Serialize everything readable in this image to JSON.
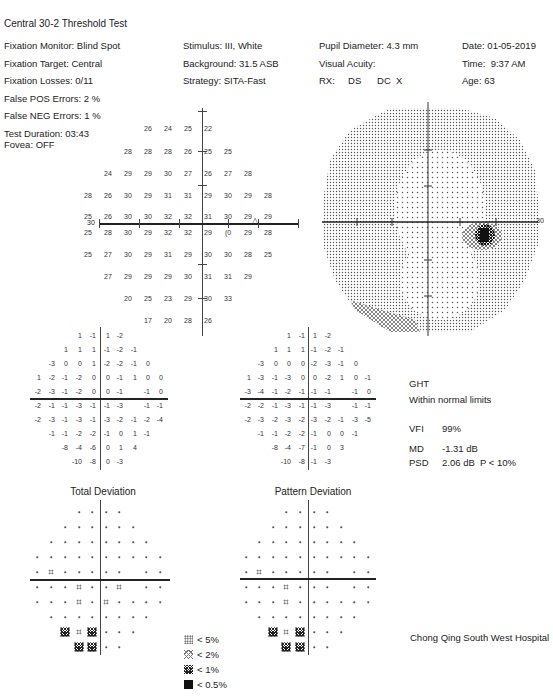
{
  "header": {
    "test_name": "Central 30-2 Threshold Test"
  },
  "patient_info": {
    "left_column": [
      "Fixation Monitor: Blind Spot",
      "Fixation Target: Central",
      "Fixation Losses: 0/11",
      "False POS Errors:   2 %",
      "False NEG Errors:   1 %",
      "Test Duration: 03:43"
    ],
    "fovea": "Fovea: OFF",
    "middle_column": [
      "Stimulus: III, White",
      "Background: 31.5 ASB",
      "Strategy: SITA-Fast"
    ],
    "right_column": [
      "Pupil Diameter: 4.3 mm",
      "Visual Acuity:",
      "RX:     DS      DC  X"
    ],
    "far_right_column": [
      "Date: 01-05-2019",
      "Time:  9:37 AM",
      "Age: 63"
    ]
  },
  "threshold_plot": {
    "axis_label_left": "30",
    "axis_label_right": "30",
    "blind_spot_marker": "△",
    "rows": [
      {
        "y": 128,
        "cells": [
          {
            "x": 148,
            "v": "26"
          },
          {
            "x": 168,
            "v": "24"
          },
          {
            "x": 188,
            "v": "25"
          },
          {
            "x": 208,
            "v": "22"
          }
        ]
      },
      {
        "y": 151,
        "cells": [
          {
            "x": 128,
            "v": "28"
          },
          {
            "x": 148,
            "v": "28"
          },
          {
            "x": 168,
            "v": "28"
          },
          {
            "x": 188,
            "v": "26"
          },
          {
            "x": 208,
            "v": "25"
          },
          {
            "x": 228,
            "v": "25"
          }
        ]
      },
      {
        "y": 173,
        "cells": [
          {
            "x": 108,
            "v": "24"
          },
          {
            "x": 128,
            "v": "29"
          },
          {
            "x": 148,
            "v": "29"
          },
          {
            "x": 168,
            "v": "30"
          },
          {
            "x": 188,
            "v": "27"
          },
          {
            "x": 208,
            "v": "26"
          },
          {
            "x": 228,
            "v": "27"
          },
          {
            "x": 248,
            "v": "28"
          }
        ]
      },
      {
        "y": 195,
        "cells": [
          {
            "x": 88,
            "v": "28"
          },
          {
            "x": 108,
            "v": "26"
          },
          {
            "x": 128,
            "v": "30"
          },
          {
            "x": 148,
            "v": "29"
          },
          {
            "x": 168,
            "v": "31"
          },
          {
            "x": 188,
            "v": "31"
          },
          {
            "x": 208,
            "v": "29"
          },
          {
            "x": 228,
            "v": "30"
          },
          {
            "x": 248,
            "v": "29"
          },
          {
            "x": 268,
            "v": "28"
          }
        ]
      },
      {
        "y": 216,
        "cells": [
          {
            "x": 88,
            "v": "25"
          },
          {
            "x": 108,
            "v": "26"
          },
          {
            "x": 128,
            "v": "30"
          },
          {
            "x": 148,
            "v": "30"
          },
          {
            "x": 168,
            "v": "32"
          },
          {
            "x": 188,
            "v": "32"
          },
          {
            "x": 208,
            "v": "31"
          },
          {
            "x": 228,
            "v": "30"
          },
          {
            "x": 248,
            "v": "29"
          },
          {
            "x": 268,
            "v": "29"
          }
        ]
      },
      {
        "y": 232,
        "cells": [
          {
            "x": 88,
            "v": "25"
          },
          {
            "x": 108,
            "v": "28"
          },
          {
            "x": 128,
            "v": "30"
          },
          {
            "x": 148,
            "v": "29"
          },
          {
            "x": 168,
            "v": "32"
          },
          {
            "x": 188,
            "v": "32"
          },
          {
            "x": 208,
            "v": "29"
          },
          {
            "x": 228,
            "v": "(0"
          },
          {
            "x": 248,
            "v": "29"
          },
          {
            "x": 268,
            "v": "28"
          }
        ]
      },
      {
        "y": 254,
        "cells": [
          {
            "x": 88,
            "v": "25"
          },
          {
            "x": 108,
            "v": "27"
          },
          {
            "x": 128,
            "v": "30"
          },
          {
            "x": 148,
            "v": "29"
          },
          {
            "x": 168,
            "v": "31"
          },
          {
            "x": 188,
            "v": "29"
          },
          {
            "x": 208,
            "v": "30"
          },
          {
            "x": 228,
            "v": "30"
          },
          {
            "x": 248,
            "v": "28"
          },
          {
            "x": 268,
            "v": "25"
          }
        ]
      },
      {
        "y": 276,
        "cells": [
          {
            "x": 108,
            "v": "27"
          },
          {
            "x": 128,
            "v": "29"
          },
          {
            "x": 148,
            "v": "29"
          },
          {
            "x": 168,
            "v": "29"
          },
          {
            "x": 188,
            "v": "30"
          },
          {
            "x": 208,
            "v": "31"
          },
          {
            "x": 228,
            "v": "31"
          },
          {
            "x": 248,
            "v": "29"
          }
        ]
      },
      {
        "y": 298,
        "cells": [
          {
            "x": 128,
            "v": "20"
          },
          {
            "x": 148,
            "v": "25"
          },
          {
            "x": 168,
            "v": "23"
          },
          {
            "x": 188,
            "v": "29"
          },
          {
            "x": 208,
            "v": "30"
          },
          {
            "x": 228,
            "v": "33"
          }
        ]
      },
      {
        "y": 320,
        "cells": [
          {
            "x": 148,
            "v": "17"
          },
          {
            "x": 168,
            "v": "20"
          },
          {
            "x": 188,
            "v": "28"
          },
          {
            "x": 208,
            "v": "26"
          }
        ]
      }
    ]
  },
  "grayscale_plot": {
    "axis_label_right": "30"
  },
  "total_deviation": {
    "title": "Total Deviation",
    "rows": [
      [
        "",
        "",
        "",
        "1",
        "-1",
        "1",
        "-2",
        "",
        "",
        ""
      ],
      [
        "",
        "",
        "1",
        "1",
        "1",
        "-1",
        "-2",
        "-1",
        "",
        ""
      ],
      [
        "",
        "-3",
        "0",
        "0",
        "1",
        "-2",
        "-2",
        "-1",
        "0",
        ""
      ],
      [
        "1",
        "-2",
        "-1",
        "-2",
        "0",
        "0",
        "-1",
        "1",
        "0",
        "0"
      ],
      [
        "-2",
        "-3",
        "-1",
        "-2",
        "0",
        "0",
        "-1",
        "",
        "-1",
        "0"
      ],
      [
        "-2",
        "-1",
        "-1",
        "-3",
        "-1",
        "-1",
        "-3",
        "",
        "-1",
        "-1"
      ],
      [
        "-2",
        "-3",
        "-1",
        "-3",
        "-1",
        "-3",
        "-2",
        "-1",
        "-2",
        "-4"
      ],
      [
        "",
        "-1",
        "-1",
        "-2",
        "-2",
        "-1",
        "0",
        "1",
        "-1",
        ""
      ],
      [
        "",
        "",
        "-8",
        "-4",
        "-6",
        "0",
        "1",
        "4",
        "",
        ""
      ],
      [
        "",
        "",
        "",
        "-10",
        "-8",
        "0",
        "-3",
        "",
        "",
        ""
      ]
    ],
    "prob_rows": [
      [
        "",
        "",
        "",
        "dot",
        "dot",
        "dot",
        "dot",
        "",
        "",
        ""
      ],
      [
        "",
        "",
        "dot",
        "dot",
        "dot",
        "dot",
        "dot",
        "dot",
        "",
        ""
      ],
      [
        "",
        "dot",
        "dot",
        "dot",
        "dot",
        "dot",
        "dot",
        "dot",
        "dot",
        ""
      ],
      [
        "dot",
        "dot",
        "dot",
        "dot",
        "dot",
        "dot",
        "dot",
        "dot",
        "dot",
        "dot"
      ],
      [
        "dot",
        "p5",
        "dot",
        "dot",
        "dot",
        "dot",
        "dot",
        "",
        "dot",
        "dot"
      ],
      [
        "dot",
        "dot",
        "dot",
        "p5",
        "dot",
        "dot",
        "p5",
        "",
        "dot",
        "dot"
      ],
      [
        "dot",
        "dot",
        "dot",
        "p5",
        "dot",
        "p5",
        "dot",
        "dot",
        "dot",
        "dot"
      ],
      [
        "",
        "dot",
        "dot",
        "dot",
        "dot",
        "dot",
        "dot",
        "dot",
        "dot",
        ""
      ],
      [
        "",
        "",
        "p1",
        "p5",
        "p1",
        "dot",
        "dot",
        "dot",
        "",
        ""
      ],
      [
        "",
        "",
        "",
        "p1",
        "p1",
        "dot",
        "dot",
        "",
        "",
        ""
      ]
    ]
  },
  "pattern_deviation": {
    "title": "Pattern Deviation",
    "rows": [
      [
        "",
        "",
        "",
        "1",
        "-1",
        "1",
        "-2",
        "",
        "",
        ""
      ],
      [
        "",
        "",
        "1",
        "1",
        "1",
        "-1",
        "-2",
        "-1",
        "",
        ""
      ],
      [
        "",
        "-3",
        "0",
        "0",
        "0",
        "-2",
        "-3",
        "-1",
        "0",
        ""
      ],
      [
        "1",
        "-3",
        "-1",
        "-3",
        "0",
        "0",
        "-2",
        "1",
        "0",
        "-1"
      ],
      [
        "-3",
        "-4",
        "-1",
        "-2",
        "-1",
        "-1",
        "-1",
        "",
        "-1",
        "0"
      ],
      [
        "-2",
        "-2",
        "-1",
        "-3",
        "-1",
        "-1",
        "-3",
        "",
        "-1",
        "-1"
      ],
      [
        "-2",
        "-3",
        "-2",
        "-3",
        "-2",
        "-3",
        "-2",
        "-1",
        "-3",
        "-5"
      ],
      [
        "",
        "-1",
        "-1",
        "-2",
        "-2",
        "-1",
        "0",
        "0",
        "-1",
        ""
      ],
      [
        "",
        "",
        "-8",
        "-4",
        "-7",
        "-1",
        "0",
        "3",
        "",
        ""
      ],
      [
        "",
        "",
        "",
        "-10",
        "-8",
        "-1",
        "-3",
        "",
        "",
        ""
      ]
    ],
    "prob_rows": [
      [
        "",
        "",
        "",
        "dot",
        "dot",
        "dot",
        "dot",
        "",
        "",
        ""
      ],
      [
        "",
        "",
        "dot",
        "dot",
        "dot",
        "dot",
        "dot",
        "dot",
        "",
        ""
      ],
      [
        "",
        "dot",
        "dot",
        "dot",
        "dot",
        "dot",
        "dot",
        "dot",
        "dot",
        ""
      ],
      [
        "dot",
        "dot",
        "dot",
        "dot",
        "dot",
        "dot",
        "dot",
        "dot",
        "dot",
        "dot"
      ],
      [
        "dot",
        "p5",
        "dot",
        "dot",
        "dot",
        "dot",
        "dot",
        "",
        "dot",
        "dot"
      ],
      [
        "dot",
        "dot",
        "dot",
        "p5",
        "dot",
        "dot",
        "dot",
        "",
        "dot",
        "dot"
      ],
      [
        "dot",
        "dot",
        "dot",
        "p5",
        "dot",
        "dot",
        "dot",
        "dot",
        "dot",
        "dot"
      ],
      [
        "",
        "dot",
        "dot",
        "dot",
        "dot",
        "dot",
        "dot",
        "dot",
        "dot",
        ""
      ],
      [
        "",
        "",
        "p1",
        "p5",
        "p1",
        "dot",
        "dot",
        "dot",
        "",
        ""
      ],
      [
        "",
        "",
        "",
        "p1",
        "p1",
        "dot",
        "dot",
        "",
        "",
        ""
      ]
    ]
  },
  "indices": {
    "ght_label": "GHT",
    "ght_value": "Within normal limits",
    "vfi_label": "VFI",
    "vfi_value": "99%",
    "md_label": "MD",
    "md_value": "-1.31 dB",
    "psd_label": "PSD",
    "psd_value": "2.06 dB  P < 10%"
  },
  "legend": [
    {
      "symbol": "p5",
      "label": "< 5%"
    },
    {
      "symbol": "p2",
      "label": "< 2%"
    },
    {
      "symbol": "p1",
      "label": "< 1%"
    },
    {
      "symbol": "p05",
      "label": "< 0.5%"
    }
  ],
  "footer": {
    "hospital": "Chong Qing South West Hospital"
  }
}
